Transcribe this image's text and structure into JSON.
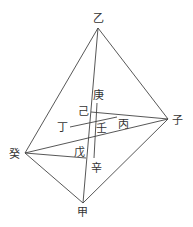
{
  "diagram": {
    "type": "geometric-figure",
    "colors": {
      "line": "#444444",
      "label": "#333333",
      "background": "#ffffff"
    },
    "points": {
      "yi": {
        "label": "乙",
        "x": 98,
        "y": 28
      },
      "zi": {
        "label": "子",
        "x": 168,
        "y": 119
      },
      "gui": {
        "label": "癸",
        "x": 25,
        "y": 153
      },
      "jia": {
        "label": "甲",
        "x": 83,
        "y": 203
      },
      "geng": {
        "label": "庚",
        "x": 97,
        "y": 103
      },
      "ji": {
        "label": "己",
        "x": 91,
        "y": 112
      },
      "ding": {
        "label": "丁",
        "x": 70,
        "y": 127
      },
      "ren": {
        "label": "壬",
        "x": 97,
        "y": 124
      },
      "bing": {
        "label": "丙",
        "x": 117,
        "y": 117
      },
      "wu": {
        "label": "戊",
        "x": 86,
        "y": 158
      },
      "xin": {
        "label": "辛",
        "x": 94,
        "y": 158
      }
    },
    "labels": [
      {
        "id": "yi",
        "text": "乙",
        "x": 93,
        "y": 22
      },
      {
        "id": "zi",
        "text": "子",
        "x": 172,
        "y": 124
      },
      {
        "id": "gui",
        "text": "癸",
        "x": 9,
        "y": 158
      },
      {
        "id": "jia",
        "text": "甲",
        "x": 77,
        "y": 216
      },
      {
        "id": "geng",
        "text": "庚",
        "x": 93,
        "y": 99
      },
      {
        "id": "ji",
        "text": "己",
        "x": 78,
        "y": 115
      },
      {
        "id": "ding",
        "text": "丁",
        "x": 57,
        "y": 131
      },
      {
        "id": "ren",
        "text": "壬",
        "x": 96,
        "y": 132
      },
      {
        "id": "bing",
        "text": "丙",
        "x": 118,
        "y": 128
      },
      {
        "id": "wu",
        "text": "戊",
        "x": 74,
        "y": 156
      },
      {
        "id": "xin",
        "text": "辛",
        "x": 91,
        "y": 172
      }
    ],
    "edges": [
      {
        "name": "yi-zi",
        "x1": 98,
        "y1": 28,
        "x2": 168,
        "y2": 119
      },
      {
        "name": "yi-gui",
        "x1": 98,
        "y1": 28,
        "x2": 25,
        "y2": 153
      },
      {
        "name": "yi-jia",
        "x1": 98,
        "y1": 28,
        "x2": 83,
        "y2": 203
      },
      {
        "name": "zi-jia",
        "x1": 168,
        "y1": 119,
        "x2": 83,
        "y2": 203
      },
      {
        "name": "gui-jia",
        "x1": 25,
        "y1": 153,
        "x2": 83,
        "y2": 203
      },
      {
        "name": "gui-zi",
        "x1": 25,
        "y1": 153,
        "x2": 168,
        "y2": 119
      },
      {
        "name": "ji-zi",
        "x1": 91,
        "y1": 112,
        "x2": 168,
        "y2": 119
      },
      {
        "name": "ding-bing",
        "x1": 70,
        "y1": 127,
        "x2": 117,
        "y2": 117
      },
      {
        "name": "gui-wu",
        "x1": 25,
        "y1": 153,
        "x2": 86,
        "y2": 158
      },
      {
        "name": "geng-xin",
        "x1": 97,
        "y1": 103,
        "x2": 94,
        "y2": 158
      }
    ]
  }
}
